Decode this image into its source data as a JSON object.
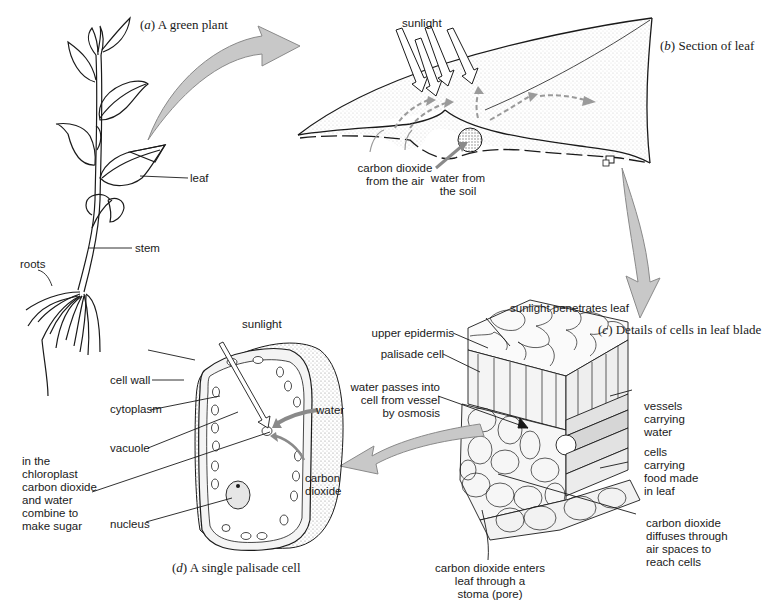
{
  "panels": {
    "a": {
      "letter": "a",
      "caption": "A green plant",
      "labels": {
        "leaf": "leaf",
        "stem": "stem",
        "roots": "roots"
      }
    },
    "b": {
      "letter": "b",
      "caption": "Section of leaf",
      "labels": {
        "sunlight": "sunlight",
        "co2_air": "carbon dioxide\nfrom the air",
        "water_soil": "water from\nthe soil"
      }
    },
    "c": {
      "letter": "c",
      "caption": "Details of cells in leaf blade",
      "labels": {
        "sunlight_penetrates": "sunlight penetrates leaf",
        "upper_epidermis": "upper epidermis",
        "palisade_cell": "palisade cell",
        "water_osmosis": "water passes into\ncell from vessel\nby osmosis",
        "vessels_water": "vessels\ncarrying\nwater",
        "cells_food": "cells\ncarrying\nfood made\nin leaf",
        "co2_diffuses": "carbon dioxide\ndiffuses through\nair spaces to\nreach cells",
        "co2_stoma": "carbon dioxide enters\nleaf through a\nstoma (pore)"
      }
    },
    "d": {
      "letter": "d",
      "caption": "A single palisade cell",
      "labels": {
        "sunlight": "sunlight",
        "cell_wall": "cell wall",
        "cytoplasm": "cytoplasm",
        "vacuole": "vacuole",
        "chloroplast": "in the\nchloroplast\ncarbon dioxide\nand water\ncombine to\nmake sugar",
        "nucleus": "nucleus",
        "water": "water",
        "co2": "carbon\ndioxide"
      }
    }
  },
  "colors": {
    "ink": "#1a1a1a",
    "arrow_fill": "#c8c8c8",
    "arrow_stroke": "#8a8a8a",
    "stipple": "#9a9a9a"
  }
}
